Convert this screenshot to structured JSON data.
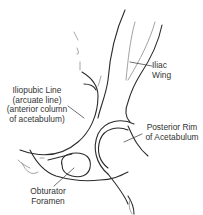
{
  "diagram": {
    "type": "anatomical line drawing",
    "labels": {
      "iliac_wing": {
        "line1": "Iliac",
        "line2": "Wing"
      },
      "iliopubic_line": {
        "line1": "Iliopubic Line",
        "line2": "(arcuate line)",
        "line3": "(anterior column",
        "line4": "of acetabulum)"
      },
      "posterior_rim": {
        "line1": "Posterior Rim",
        "line2": "of Acetabulum"
      },
      "obturator_foramen": {
        "line1": "Obturator",
        "line2": "Foramen"
      }
    },
    "colors": {
      "line": "#2b2b2b",
      "text": "#333333",
      "background": "#ffffff"
    }
  }
}
